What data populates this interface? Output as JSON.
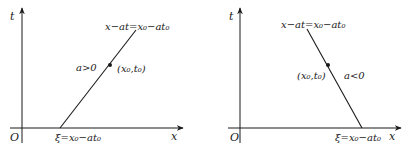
{
  "panels": [
    {
      "id": "left",
      "axis_t_label": "t",
      "axis_x_label": "x",
      "origin_label": "O",
      "line_label": "x−at=x₀−at₀",
      "intercept_label": "ξ=x₀−at₀",
      "point_label": "(x₀,t₀)",
      "condition_label": "a>0",
      "slope_sign": "positive"
    },
    {
      "id": "right",
      "axis_t_label": "t",
      "axis_x_label": "x",
      "origin_label": "O",
      "line_label": "x−at=x₀−at₀",
      "intercept_label": "ξ=x₀−at₀",
      "point_label": "(x₀,t₀)",
      "condition_label": "a<0",
      "slope_sign": "negative"
    }
  ],
  "colors": {
    "ink": "#1a1a1a",
    "background": "#ffffff"
  }
}
